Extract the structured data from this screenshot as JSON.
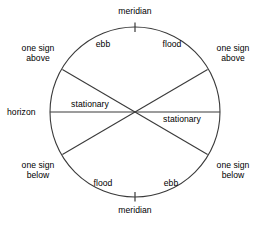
{
  "diagram": {
    "shape": "circle",
    "stroke_color": "#3a3a3a",
    "background_color": "#ffffff",
    "geometry": {
      "center_x": 135,
      "center_y": 112,
      "radius": 85
    },
    "axis_ticks": [
      {
        "name": "meridian-tick-top",
        "position": "top"
      },
      {
        "name": "meridian-tick-bottom",
        "position": "bottom"
      }
    ],
    "lines": [
      {
        "name": "horizon-line",
        "orientation": "horizontal",
        "from": "left-edge",
        "to": "right-edge"
      },
      {
        "name": "one-sign-above-below-chord-left",
        "orientation": "diagonal",
        "from": "upper-left-edge",
        "to": "lower-right-edge"
      },
      {
        "name": "one-sign-above-below-chord-right",
        "orientation": "diagonal",
        "from": "upper-right-edge",
        "to": "lower-left-edge"
      }
    ],
    "outer_labels": [
      {
        "name": "label-meridian-top",
        "text": "meridian",
        "position": "top"
      },
      {
        "name": "label-one-sign-above-left",
        "text": "one sign\nabove",
        "position": "upper-left"
      },
      {
        "name": "label-one-sign-above-right",
        "text": "one sign\nabove",
        "position": "upper-right"
      },
      {
        "name": "label-horizon",
        "text": "horizon",
        "position": "left"
      },
      {
        "name": "label-one-sign-below-left",
        "text": "one sign\nbelow",
        "position": "lower-left"
      },
      {
        "name": "label-one-sign-below-right",
        "text": "one sign\nbelow",
        "position": "lower-right"
      },
      {
        "name": "label-meridian-bottom",
        "text": "meridian",
        "position": "bottom"
      }
    ],
    "inner_labels": [
      {
        "name": "label-ebb-top",
        "text": "ebb",
        "sector": "upper-left"
      },
      {
        "name": "label-flood-top",
        "text": "flood",
        "sector": "upper-right"
      },
      {
        "name": "label-stationary-left",
        "text": "stationary",
        "sector": "left-above-horizon"
      },
      {
        "name": "label-stationary-right",
        "text": "stationary",
        "sector": "right-below-horizon"
      },
      {
        "name": "label-flood-bottom",
        "text": "flood",
        "sector": "lower-left"
      },
      {
        "name": "label-ebb-bottom",
        "text": "ebb",
        "sector": "lower-right"
      }
    ],
    "text": {
      "meridian_top": "meridian",
      "meridian_bottom": "meridian",
      "horizon": "horizon",
      "one_sign_above_left_line1": "one sign",
      "one_sign_above_left_line2": "above",
      "one_sign_above_right_line1": "one sign",
      "one_sign_above_right_line2": "above",
      "one_sign_below_left_line1": "one sign",
      "one_sign_below_left_line2": "below",
      "one_sign_below_right_line1": "one sign",
      "one_sign_below_right_line2": "below",
      "ebb_top": "ebb",
      "flood_top": "flood",
      "stationary_left": "stationary",
      "stationary_right": "stationary",
      "flood_bottom": "flood",
      "ebb_bottom": "ebb"
    }
  }
}
